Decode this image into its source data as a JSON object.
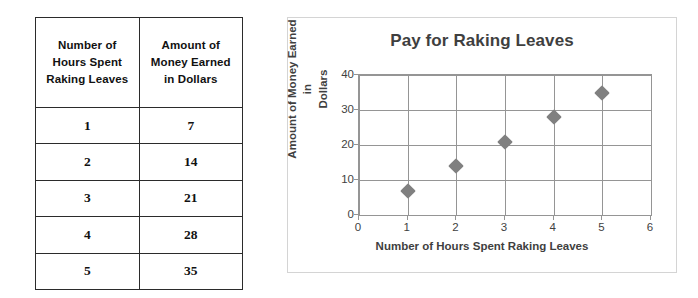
{
  "table": {
    "headers": [
      [
        "Number of",
        "Hours Spent",
        "Raking Leaves"
      ],
      [
        "Amount of",
        "Money Earned",
        "in Dollars"
      ]
    ],
    "rows": [
      [
        "1",
        "7"
      ],
      [
        "2",
        "14"
      ],
      [
        "3",
        "21"
      ],
      [
        "4",
        "28"
      ],
      [
        "5",
        "35"
      ]
    ]
  },
  "chart_data": {
    "type": "scatter",
    "title": "Pay for Raking Leaves",
    "xlabel": "Number of Hours Spent Raking Leaves",
    "ylabel": "Amount of Money Earned in Dollars",
    "ylabel_lines": [
      "Amount of Money Earned in",
      "Dollars"
    ],
    "x": [
      1,
      2,
      3,
      4,
      5
    ],
    "values": [
      7,
      14,
      21,
      28,
      35
    ],
    "xlim": [
      0,
      6
    ],
    "ylim": [
      0,
      40
    ],
    "xticks": [
      "0",
      "1",
      "2",
      "3",
      "4",
      "5",
      "6"
    ],
    "yticks": [
      "0",
      "10",
      "20",
      "30",
      "40"
    ],
    "grid": true,
    "legend": "none",
    "marker": "diamond",
    "marker_color": "#808080",
    "gridline_color": "#959595",
    "title_color": "#3f3f3f",
    "panel_border_color": "#d4d4d4"
  }
}
